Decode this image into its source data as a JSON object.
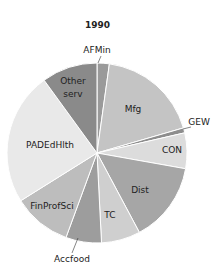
{
  "chart_data": {
    "type": "pie",
    "title": "1990",
    "start_angle_deg": 0,
    "direction": "clockwise",
    "slices": [
      {
        "label": "AFMin",
        "value": 2.2,
        "color": "#9a9a9a"
      },
      {
        "label": "Mfg",
        "value": 18.3,
        "color": "#c4c4c4"
      },
      {
        "label": "GEW",
        "value": 0.9,
        "color": "#8d8d8d"
      },
      {
        "label": "CON",
        "value": 6.4,
        "color": "#dcdcdc"
      },
      {
        "label": "Dist",
        "value": 14.4,
        "color": "#a6a6a6"
      },
      {
        "label": "TC",
        "value": 7.0,
        "color": "#cfcfcf"
      },
      {
        "label": "Accfood",
        "value": 6.4,
        "color": "#9d9d9d"
      },
      {
        "label": "FinProfSci",
        "value": 10.5,
        "color": "#bdbdbd"
      },
      {
        "label": "PADEdHlth",
        "value": 23.9,
        "color": "#e9e9e9"
      },
      {
        "label": "Other serv",
        "value": 10.0,
        "color": "#8a8a8a"
      }
    ]
  }
}
